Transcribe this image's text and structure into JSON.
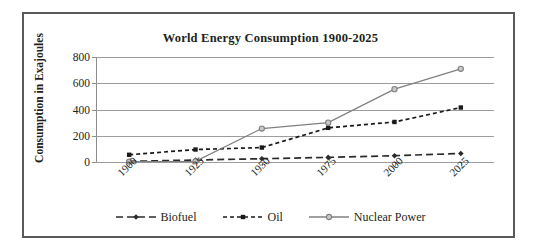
{
  "chart_data": {
    "type": "line",
    "title": "World Energy Consumption 1900-2025",
    "xlabel": "",
    "ylabel": "Consumption in Exajoules",
    "categories": [
      "1900",
      "1925",
      "1950",
      "1975",
      "2000",
      "2025"
    ],
    "yticks": [
      "0",
      "200",
      "400",
      "600",
      "800"
    ],
    "ylim": [
      0,
      800
    ],
    "grid": true,
    "legend_position": "bottom",
    "series": [
      {
        "name": "Biofuel",
        "values": [
          5,
          15,
          25,
          35,
          48,
          65
        ],
        "line_style": "long-dash",
        "marker": "diamond",
        "color": "#2b2b2b"
      },
      {
        "name": "Oil",
        "values": [
          55,
          95,
          110,
          260,
          305,
          415
        ],
        "line_style": "short-dash",
        "marker": "square",
        "color": "#1a1a1a"
      },
      {
        "name": "Nuclear Power",
        "values": [
          3,
          5,
          255,
          300,
          555,
          710
        ],
        "line_style": "solid",
        "marker": "circle",
        "color": "#808080"
      }
    ]
  },
  "frame": {
    "border_color": "#5a5a5a",
    "background": "#ffffff",
    "gridline_color": "#9d9d9d",
    "axis_color": "#8c8c8c"
  }
}
